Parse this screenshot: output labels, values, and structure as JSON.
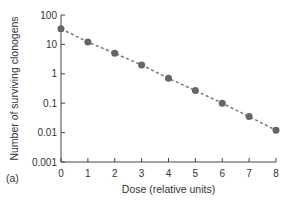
{
  "chart_data": {
    "type": "scatter",
    "title": "",
    "panel_label": "(a)",
    "xlabel": "Dose (relative units)",
    "ylabel": "Number of surviving clonogens",
    "x_ticks": [
      "0",
      "1",
      "2",
      "3",
      "4",
      "5",
      "6",
      "7",
      "8"
    ],
    "y_ticks": [
      "100",
      "10",
      "1",
      "0.1",
      "0.01",
      "0.001"
    ],
    "xlim": [
      0,
      8
    ],
    "ylim": [
      0.001,
      100
    ],
    "y_scale": "log",
    "grid": false,
    "series": [
      {
        "name": "surviving clonogens",
        "x": [
          0,
          1,
          2,
          3,
          4,
          5,
          6,
          7,
          8
        ],
        "values": [
          34,
          12,
          5,
          2,
          0.7,
          0.27,
          0.1,
          0.035,
          0.012
        ],
        "marker_color": "#666666",
        "line_style": "dashed"
      }
    ]
  }
}
